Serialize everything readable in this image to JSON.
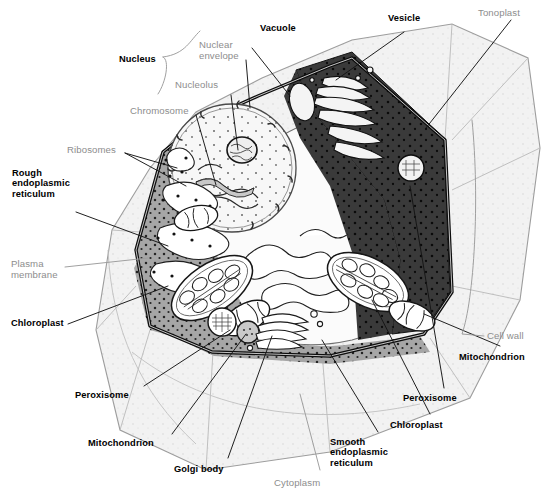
{
  "figure": {
    "colors": {
      "bold_label": "#000000",
      "soft_label": "#8d8d8d",
      "leader_line": "#1a1a1a",
      "soft_leader_line": "#9a9a9a",
      "cell_wall": "#f2f2f2",
      "cell_wall_outline": "#9d9d9d",
      "plasma_membrane": "#0d0d0d",
      "cytoplasm_light": "#a6a6a6",
      "cytoplasm_dark": "#3a3a3a",
      "vacuole": "#fbfbfb",
      "nucleus": "#f7f7f7",
      "organelle_fill": "#ffffff",
      "organelle_stroke": "#1f1f1f"
    },
    "labels": [
      {
        "id": "nucleus",
        "text": "Nucleus",
        "style": "bold",
        "x": 119,
        "y": 54,
        "align": "left"
      },
      {
        "id": "nuclear-envelope",
        "text": "Nuclear\nenvelope",
        "style": "soft",
        "x": 199,
        "y": 40,
        "align": "left"
      },
      {
        "id": "nucleolus",
        "text": "Nucleolus",
        "style": "soft",
        "x": 175,
        "y": 80,
        "align": "left"
      },
      {
        "id": "chromosome",
        "text": "Chromosome",
        "style": "soft",
        "x": 130,
        "y": 106,
        "align": "left"
      },
      {
        "id": "ribosomes",
        "text": "Ribosomes",
        "style": "soft",
        "x": 67,
        "y": 145,
        "align": "left"
      },
      {
        "id": "rough-endoplasmic-reticulum",
        "text": "Rough\nendoplasmic\nreticulum",
        "style": "bold",
        "x": 12,
        "y": 168,
        "align": "left"
      },
      {
        "id": "plasma-membrane",
        "text": "Plasma\nmembrane",
        "style": "soft",
        "x": 11,
        "y": 259,
        "align": "left"
      },
      {
        "id": "chloroplast-left",
        "text": "Chloroplast",
        "style": "bold",
        "x": 11,
        "y": 318,
        "align": "left"
      },
      {
        "id": "peroxisome-left",
        "text": "Peroxisome",
        "style": "bold",
        "x": 75,
        "y": 390,
        "align": "left"
      },
      {
        "id": "mitochondrion-left",
        "text": "Mitochondrion",
        "style": "bold",
        "x": 88,
        "y": 438,
        "align": "left"
      },
      {
        "id": "golgi-body",
        "text": "Golgi body",
        "style": "bold",
        "x": 174,
        "y": 464,
        "align": "left"
      },
      {
        "id": "cytoplasm",
        "text": "Cytoplasm",
        "style": "soft",
        "x": 274,
        "y": 478,
        "align": "left"
      },
      {
        "id": "smooth-endoplasmic-reticulum",
        "text": "Smooth\nendoplasmic\nreticulum",
        "style": "bold",
        "x": 330,
        "y": 437,
        "align": "left"
      },
      {
        "id": "chloroplast-right",
        "text": "Chloroplast",
        "style": "bold",
        "x": 390,
        "y": 420,
        "align": "left"
      },
      {
        "id": "peroxisome-right",
        "text": "Peroxisome",
        "style": "bold",
        "x": 403,
        "y": 393,
        "align": "left"
      },
      {
        "id": "mitochondrion-right",
        "text": "Mitochondrion",
        "style": "bold",
        "x": 459,
        "y": 352,
        "align": "left"
      },
      {
        "id": "cell-wall",
        "text": "Cell wall",
        "style": "soft",
        "x": 487,
        "y": 331,
        "align": "left"
      },
      {
        "id": "tonoplast",
        "text": "Tonoplast",
        "style": "soft",
        "x": 478,
        "y": 8,
        "align": "left"
      },
      {
        "id": "vesicle",
        "text": "Vesicle",
        "style": "bold",
        "x": 388,
        "y": 13,
        "align": "left"
      },
      {
        "id": "vacuole",
        "text": "Vacuole",
        "style": "bold",
        "x": 260,
        "y": 23,
        "align": "left"
      }
    ],
    "structures": [
      {
        "id": "cell-wall",
        "name": "Cell wall"
      },
      {
        "id": "plasma-membrane",
        "name": "Plasma membrane"
      },
      {
        "id": "cytoplasm",
        "name": "Cytoplasm"
      },
      {
        "id": "nucleus",
        "name": "Nucleus"
      },
      {
        "id": "nucleolus",
        "name": "Nucleolus"
      },
      {
        "id": "nuclear-envelope",
        "name": "Nuclear envelope"
      },
      {
        "id": "chromosome",
        "name": "Chromosome"
      },
      {
        "id": "vacuole",
        "name": "Vacuole"
      },
      {
        "id": "tonoplast",
        "name": "Tonoplast"
      },
      {
        "id": "chloroplast",
        "name": "Chloroplast"
      },
      {
        "id": "mitochondrion",
        "name": "Mitochondrion"
      },
      {
        "id": "peroxisome",
        "name": "Peroxisome"
      },
      {
        "id": "golgi-body",
        "name": "Golgi body"
      },
      {
        "id": "rough-er",
        "name": "Rough endoplasmic reticulum"
      },
      {
        "id": "smooth-er",
        "name": "Smooth endoplasmic reticulum"
      },
      {
        "id": "ribosomes",
        "name": "Ribosomes"
      },
      {
        "id": "vesicle",
        "name": "Vesicle"
      }
    ]
  }
}
